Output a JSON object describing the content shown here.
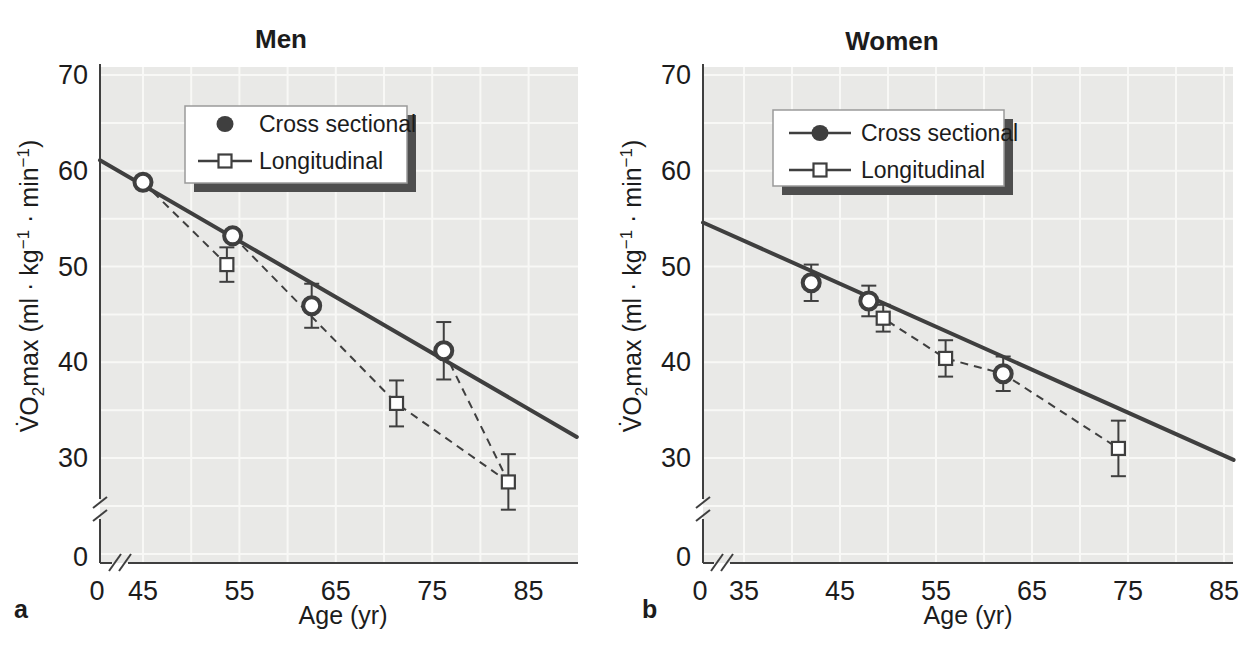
{
  "chart_data": {
    "type": "line",
    "xlabel": "Age (yr)",
    "ylabel": "V̇O₂max (ml · kg⁻¹ · min⁻¹)",
    "ylabel_parts": [
      {
        "t": "V̇O"
      },
      {
        "t": "2",
        "s": "sub"
      },
      {
        "t": "max (ml · kg"
      },
      {
        "t": "−1",
        "s": "sup"
      },
      {
        "t": " · min"
      },
      {
        "t": "−1",
        "s": "sup"
      },
      {
        "t": ")"
      }
    ],
    "legend_labels": [
      "Cross sectional",
      "Longitudinal"
    ],
    "panels": [
      {
        "id": "a",
        "title": "Men",
        "letter": "a",
        "x_ticks": [
          0,
          45,
          55,
          65,
          75,
          85
        ],
        "y_ticks": [
          70,
          60,
          50,
          40,
          30,
          0
        ],
        "x_break": true,
        "y_break": true,
        "ylim": [
          0,
          70
        ],
        "xlim_display": [
          45,
          90
        ],
        "legend": {
          "items": [
            {
              "label": "Cross sectional",
              "marker": "filled-circle",
              "line_through": false
            },
            {
              "label": "Longitudinal",
              "marker": "open-square",
              "line_through": true
            }
          ]
        },
        "cross_sectional": {
          "regression_line": {
            "v_at_left_axis": 61.1,
            "end": {
              "age": 90,
              "vo2max": 32.2
            }
          },
          "points": [
            {
              "age": 45,
              "vo2max": 58.8
            },
            {
              "age": 54.3,
              "vo2max": 53.2
            },
            {
              "age": 62.5,
              "vo2max": 45.9,
              "err": 2.3
            },
            {
              "age": 76.2,
              "vo2max": 41.2,
              "err": 3.0
            }
          ]
        },
        "longitudinal": {
          "points": [
            {
              "age": 53.7,
              "vo2max": 50.2,
              "err": 1.8
            },
            {
              "age": 71.3,
              "vo2max": 35.7,
              "err": 2.4
            },
            {
              "age": 82.9,
              "vo2max": 27.5,
              "err": 2.9
            }
          ],
          "dashed_segments": [
            [
              [
                45,
                58.8
              ],
              [
                53.7,
                50.2
              ]
            ],
            [
              [
                54.3,
                53.2
              ],
              [
                71.3,
                35.7
              ],
              [
                82.9,
                27.5
              ]
            ],
            [
              [
                76.2,
                41.2
              ],
              [
                82.9,
                27.5
              ]
            ]
          ]
        }
      },
      {
        "id": "b",
        "title": "Women",
        "letter": "b",
        "x_ticks": [
          0,
          35,
          45,
          55,
          65,
          75,
          85
        ],
        "y_ticks": [
          70,
          60,
          50,
          40,
          30,
          0
        ],
        "x_break": true,
        "y_break": true,
        "ylim": [
          0,
          70
        ],
        "xlim_display": [
          35,
          86
        ],
        "legend": {
          "items": [
            {
              "label": "Cross sectional",
              "marker": "filled-circle",
              "line_through": true
            },
            {
              "label": "Longitudinal",
              "marker": "open-square",
              "line_through": true
            }
          ]
        },
        "cross_sectional": {
          "regression_line": {
            "v_at_left_axis": 54.6,
            "end": {
              "age": 86,
              "vo2max": 29.8
            }
          },
          "points": [
            {
              "age": 42,
              "vo2max": 48.3,
              "err": 1.9
            },
            {
              "age": 48,
              "vo2max": 46.4,
              "err": 1.6
            },
            {
              "age": 62,
              "vo2max": 38.8,
              "err": 1.8
            }
          ]
        },
        "longitudinal": {
          "points": [
            {
              "age": 49.5,
              "vo2max": 44.6,
              "err": 1.4
            },
            {
              "age": 56,
              "vo2max": 40.4,
              "err": 1.9
            },
            {
              "age": 74,
              "vo2max": 31.0,
              "err": 2.9
            }
          ],
          "dashed_segments": [
            [
              [
                48,
                46.4
              ],
              [
                49.5,
                44.6
              ],
              [
                56,
                40.4
              ],
              [
                62,
                38.8
              ],
              [
                74,
                31.0
              ]
            ]
          ]
        }
      }
    ],
    "colors": {
      "ink": "#3f3f3f",
      "text": "#1c1c1c",
      "plot_bg": "#e9e9e7",
      "grid": "#f8f8f6",
      "legend_shadow": "#4e4e4e",
      "marker_fill": "#ffffff"
    }
  }
}
